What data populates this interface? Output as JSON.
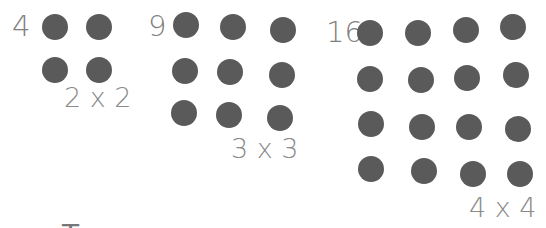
{
  "groups": [
    {
      "count_label": "4",
      "dimension_label": "2 x 2",
      "rows": 2,
      "cols": 2
    },
    {
      "count_label": "9",
      "dimension_label": "3 x 3",
      "rows": 3,
      "cols": 3
    },
    {
      "count_label": "16",
      "dimension_label": "4 x 4",
      "rows": 4,
      "cols": 4
    }
  ],
  "cropped_text": "T",
  "colors": {
    "dot": "#5a5a5a",
    "text": "#808080"
  }
}
